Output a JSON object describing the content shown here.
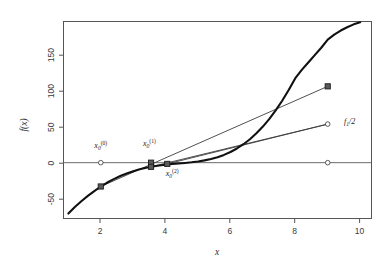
{
  "chart_data": {
    "type": "line",
    "title": "",
    "subtitle": "",
    "xlabel": "x",
    "ylabel": "f(x)",
    "xlim": [
      0.85,
      10.35
    ],
    "ylim": [
      -68,
      172
    ],
    "grid": false,
    "legend_position": "none",
    "x_ticks": [
      "2",
      "4",
      "6",
      "8",
      "10"
    ],
    "x_tick_values": [
      2,
      4,
      6,
      8,
      10
    ],
    "y_ticks": [
      "-50",
      "0",
      "50",
      "100",
      "150"
    ],
    "y_tick_values": [
      -50,
      0,
      50,
      100,
      150
    ],
    "series": [
      {
        "name": "f(x)",
        "type": "curve",
        "x": [
          1.0,
          1.2,
          1.4,
          1.6,
          1.8,
          2.0,
          2.2,
          2.4,
          2.6,
          2.8,
          3.0,
          3.2,
          3.4,
          3.6,
          3.8,
          4.0,
          4.2,
          4.4,
          4.6,
          4.8,
          5.0,
          5.2,
          5.4,
          5.6,
          5.8,
          6.0,
          6.2,
          6.4,
          6.6,
          6.8,
          7.0,
          7.2,
          7.4,
          7.6,
          7.8,
          8.0,
          8.2,
          8.4,
          8.6,
          8.8,
          9.0,
          9.2,
          9.4,
          9.6,
          9.8,
          10.0
        ],
        "y": [
          -62.0,
          -54.0,
          -47.0,
          -40.5,
          -34.6,
          -29.0,
          -24.2,
          -20.0,
          -16.3,
          -13.1,
          -10.3,
          -8.0,
          -6.1,
          -4.6,
          -3.4,
          -2.5,
          -1.7,
          -1.0,
          -0.3,
          0.5,
          1.5,
          2.8,
          4.5,
          6.7,
          9.5,
          13.0,
          17.3,
          22.5,
          28.6,
          35.8,
          44.0,
          53.4,
          64.0,
          75.8,
          88.8,
          103.0,
          113.0,
          122.0,
          131.0,
          140.0,
          150.0,
          156.0,
          161.0,
          165.0,
          168.5,
          171.0
        ]
      },
      {
        "name": "secant-chord-1",
        "type": "segment",
        "x": [
          2.0,
          9.0
        ],
        "y": [
          -29.0,
          93.0
        ]
      },
      {
        "name": "secant-chord-2",
        "type": "segment",
        "x": [
          3.55,
          9.0
        ],
        "y": [
          -5.0,
          47.0
        ]
      },
      {
        "name": "secant-chord-3",
        "type": "segment",
        "x": [
          4.05,
          9.0
        ],
        "y": [
          -1.5,
          47.0
        ]
      }
    ],
    "points": [
      {
        "name": "x0-iter0-root-marker",
        "x": 2.0,
        "y": 0,
        "marker": "circle",
        "label": ""
      },
      {
        "name": "x0-iter0-curve-marker",
        "x": 2.0,
        "y": -29.0,
        "marker": "square",
        "label": ""
      },
      {
        "name": "x0-iter1-root-marker",
        "x": 3.55,
        "y": 0,
        "marker": "square",
        "label": ""
      },
      {
        "name": "x0-iter1-curve-marker",
        "x": 3.55,
        "y": -5.0,
        "marker": "square",
        "label": ""
      },
      {
        "name": "x0-iter2-root-marker",
        "x": 4.05,
        "y": -1.5,
        "marker": "square",
        "label": ""
      },
      {
        "name": "right-bracket-curve-marker",
        "x": 9.0,
        "y": 93.0,
        "marker": "square",
        "label": ""
      },
      {
        "name": "half-f-marker",
        "x": 9.0,
        "y": 47.0,
        "marker": "circle",
        "label": ""
      },
      {
        "name": "right-bracket-root-marker",
        "x": 9.0,
        "y": 0,
        "marker": "circle",
        "label": ""
      }
    ],
    "annotations": [
      {
        "name": "label-x0-iter0",
        "text": "x0(0)",
        "base": "x",
        "sub": "0",
        "sup": "(0)",
        "x": 2.0,
        "y": 18
      },
      {
        "name": "label-x0-iter1",
        "text": "x0(1)",
        "base": "x",
        "sub": "0",
        "sup": "(1)",
        "x": 3.5,
        "y": 20
      },
      {
        "name": "label-x0-iter2",
        "text": "x0(2)",
        "base": "x",
        "sub": "0",
        "sup": "(2)",
        "x": 4.2,
        "y": -16
      },
      {
        "name": "label-f-half",
        "text": "f1/2",
        "base": "f",
        "sub": "1",
        "sup": "",
        "tail": "/2",
        "x": 9.5,
        "y": 47
      }
    ]
  }
}
